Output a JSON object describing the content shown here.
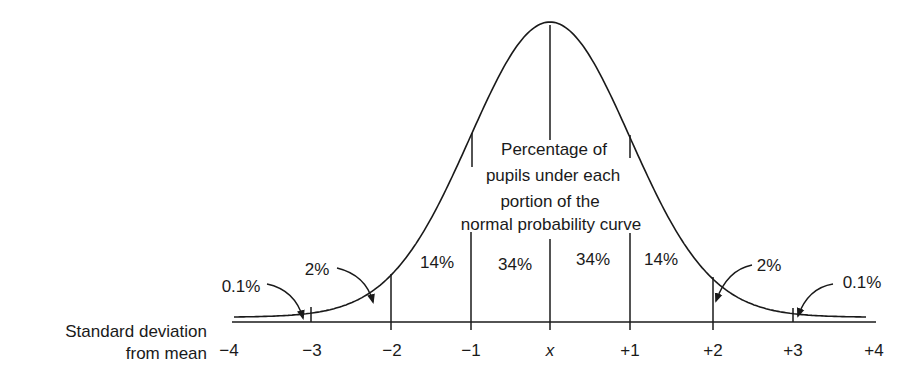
{
  "diagram": {
    "title_lines": [
      "Percentage of",
      "pupils under each",
      "portion of the",
      "normal probability curve"
    ],
    "axis_label_lines": [
      "Standard deviation",
      "from mean"
    ],
    "ticks": [
      "−4",
      "−3",
      "−2",
      "−1",
      "x",
      "+1",
      "+2",
      "+3",
      "+4"
    ],
    "regions": {
      "left_tail": "0.1%",
      "left_2": "2%",
      "left_14": "14%",
      "left_34": "34%",
      "right_34": "34%",
      "right_14": "14%",
      "right_2": "2%",
      "right_tail": "0.1%"
    },
    "line_color": "#1a1a1a"
  },
  "chart_data": {
    "type": "area",
    "title": "Percentage of pupils under each portion of the normal probability curve",
    "xlabel": "Standard deviation from mean",
    "ylabel": "",
    "x_ticks": [
      "-4",
      "-3",
      "-2",
      "-1",
      "x",
      "+1",
      "+2",
      "+3",
      "+4"
    ],
    "xlim": [
      -4,
      4
    ],
    "grid": false,
    "legend": null,
    "segments": [
      {
        "range": [
          "-4",
          "-3"
        ],
        "percent": 0.1
      },
      {
        "range": [
          "-3",
          "-2"
        ],
        "percent": 2
      },
      {
        "range": [
          "-2",
          "-1"
        ],
        "percent": 14
      },
      {
        "range": [
          "-1",
          "x"
        ],
        "percent": 34
      },
      {
        "range": [
          "x",
          "+1"
        ],
        "percent": 34
      },
      {
        "range": [
          "+1",
          "+2"
        ],
        "percent": 14
      },
      {
        "range": [
          "+2",
          "+3"
        ],
        "percent": 2
      },
      {
        "range": [
          "+3",
          "+4"
        ],
        "percent": 0.1
      }
    ]
  }
}
